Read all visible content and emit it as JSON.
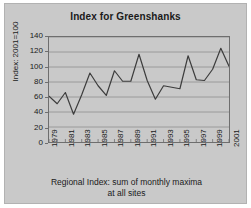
{
  "chart_data": {
    "type": "line",
    "title": "Index for Greenshanks",
    "xlabel": "Regional Index: sum of monthly maxima at all sites",
    "ylabel": "Index: 2001=100",
    "xlim": [
      1979,
      2001
    ],
    "ylim": [
      0,
      140
    ],
    "ytick_values": [
      0,
      20,
      40,
      60,
      80,
      100,
      120,
      140
    ],
    "ytick_labels": [
      "0",
      "20",
      "40",
      "60",
      "80",
      "100",
      "120",
      "140"
    ],
    "xtick_labels": [
      "1979",
      "1981",
      "1983",
      "1985",
      "1987",
      "1989",
      "1991",
      "1993",
      "1995",
      "1997",
      "1999",
      "2001"
    ],
    "xtick_values": [
      1979,
      1981,
      1983,
      1985,
      1987,
      1989,
      1991,
      1993,
      1995,
      1997,
      1999,
      2001
    ],
    "x": [
      1979,
      1980,
      1981,
      1982,
      1983,
      1984,
      1985,
      1986,
      1987,
      1988,
      1989,
      1990,
      1991,
      1992,
      1993,
      1994,
      1995,
      1996,
      1997,
      1998,
      1999,
      2000,
      2001
    ],
    "values": [
      61,
      51,
      66,
      37,
      63,
      92,
      75,
      62,
      95,
      81,
      81,
      117,
      82,
      57,
      75,
      73,
      71,
      115,
      83,
      82,
      97,
      125,
      101
    ],
    "series": [
      {
        "name": "Regional Index",
        "values": [
          61,
          51,
          66,
          37,
          63,
          92,
          75,
          62,
          95,
          81,
          81,
          117,
          82,
          57,
          75,
          73,
          71,
          115,
          83,
          82,
          97,
          125,
          101
        ]
      }
    ],
    "grid": true,
    "grid_axis": "y",
    "legend": false,
    "line_color": "#3c3c3c",
    "background_color": "#c9c9c9",
    "axis_color": "#6e6e6e"
  },
  "caption": {
    "line1": "Regional Index: sum of monthly maxima",
    "line2": "at all sites"
  }
}
